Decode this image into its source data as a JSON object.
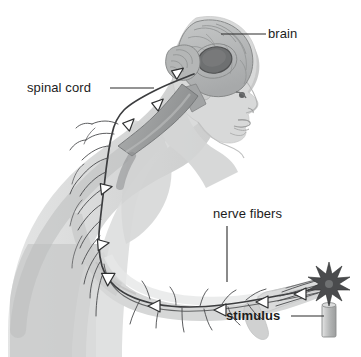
{
  "figure": {
    "background_color": "#ffffff",
    "ink_color": "#1c1c1c",
    "body_fill": "#d7d8d8",
    "body_shade": "#c2c3c3",
    "body_light": "#e4e5e5",
    "brain_fill": "#b9bbbb",
    "brain_dark": "#6f7172",
    "nerve_color": "#3c3d3f",
    "cord_fill": "#9a9c9d",
    "candle_fill": "#bdbfbf",
    "flame_color": "#4a4b4d",
    "leader_color": "#2a2a2a"
  },
  "labels": [
    {
      "id": "brain",
      "text": "brain",
      "bold": false,
      "x": 268,
      "y": 27,
      "leader": {
        "x1": 258,
        "y1": 34,
        "x2": 222,
        "y2": 34,
        "type": "horizontal"
      }
    },
    {
      "id": "spinal_cord",
      "text": "spinal cord",
      "bold": false,
      "x": 27,
      "y": 81,
      "leader": {
        "x1": 110,
        "y1": 88,
        "x2": 153,
        "y2": 88,
        "type": "horizontal"
      }
    },
    {
      "id": "nerve_fibers",
      "text": "nerve fibers",
      "bold": false,
      "x": 213,
      "y": 207,
      "leader": {
        "x1": 227,
        "y1": 225,
        "x2": 227,
        "y2": 281,
        "type": "vertical"
      }
    },
    {
      "id": "stimulus",
      "text": "stimulus",
      "bold": true,
      "x": 226,
      "y": 309,
      "leader": {
        "x1": 292,
        "y1": 316,
        "x2": 324,
        "y2": 316,
        "type": "horizontal"
      }
    }
  ],
  "anatomy": {
    "brain_parts": [
      "cerebrum",
      "cerebellum",
      "thalamus",
      "brainstem"
    ],
    "pathway_direction": "from hand up the arm, through spinal cord, to brain",
    "arrow_markers": 9,
    "stimulus_object": "lit candle",
    "stimulus_effect": "starburst flame touching fingertips"
  }
}
